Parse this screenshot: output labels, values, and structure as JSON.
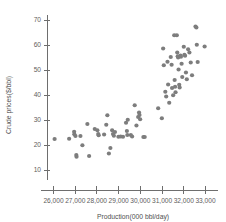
{
  "chart": {
    "title_fragment": "",
    "marker_color": "#7d7d7d",
    "axis_color": "#6e6e6e",
    "text_color": "#5d5d5d"
  },
  "chart_data": {
    "type": "scatter",
    "title": "",
    "xlabel": "Production(000 bbl/day)",
    "ylabel": "Crude prices($/bbl)",
    "xlim": [
      25700,
      33300
    ],
    "ylim": [
      6,
      73
    ],
    "xticks": [
      26000,
      27000,
      28000,
      29000,
      30000,
      31000,
      32000,
      33000
    ],
    "xtick_labels": [
      "26,000",
      "27,000",
      "28,000",
      "29,000",
      "30,000",
      "31,000",
      "32,000",
      "33,000"
    ],
    "yticks": [
      10,
      20,
      30,
      40,
      50,
      60,
      70
    ],
    "ytick_labels": [
      "10",
      "20",
      "30",
      "40",
      "50",
      "60",
      "70"
    ],
    "grid": false,
    "legend": null,
    "marker_size": 2.1,
    "points": [
      [
        26050,
        22.4
      ],
      [
        26720,
        22.5
      ],
      [
        26950,
        25.3
      ],
      [
        26960,
        24.3
      ],
      [
        27010,
        23.6
      ],
      [
        27050,
        16.0
      ],
      [
        27060,
        15.3
      ],
      [
        27240,
        23.6
      ],
      [
        27330,
        19.9
      ],
      [
        27560,
        28.4
      ],
      [
        27640,
        15.6
      ],
      [
        27900,
        26.4
      ],
      [
        28020,
        25.9
      ],
      [
        28060,
        24.4
      ],
      [
        28080,
        23.9
      ],
      [
        28330,
        24.2
      ],
      [
        28430,
        28.1
      ],
      [
        28480,
        31.9
      ],
      [
        28550,
        16.6
      ],
      [
        28620,
        18.8
      ],
      [
        28700,
        25.9
      ],
      [
        28740,
        24.4
      ],
      [
        28780,
        23.7
      ],
      [
        28830,
        25.2
      ],
      [
        28990,
        23.3
      ],
      [
        29090,
        23.4
      ],
      [
        29200,
        23.3
      ],
      [
        29340,
        28.9
      ],
      [
        29380,
        25.6
      ],
      [
        29400,
        24.0
      ],
      [
        29420,
        30.1
      ],
      [
        29560,
        24.0
      ],
      [
        29620,
        23.4
      ],
      [
        29740,
        35.9
      ],
      [
        29820,
        27.8
      ],
      [
        29900,
        31.2
      ],
      [
        29940,
        33.0
      ],
      [
        29960,
        32.0
      ],
      [
        29990,
        30.3
      ],
      [
        30140,
        23.2
      ],
      [
        30200,
        23.2
      ],
      [
        30820,
        34.7
      ],
      [
        30990,
        30.7
      ],
      [
        31050,
        58.6
      ],
      [
        31080,
        51.9
      ],
      [
        31150,
        41.3
      ],
      [
        31190,
        39.4
      ],
      [
        31250,
        53.3
      ],
      [
        31280,
        44.2
      ],
      [
        31330,
        36.9
      ],
      [
        31400,
        55.2
      ],
      [
        31440,
        52.1
      ],
      [
        31460,
        42.8
      ],
      [
        31510,
        39.9
      ],
      [
        31560,
        63.9
      ],
      [
        31580,
        46.0
      ],
      [
        31600,
        43.3
      ],
      [
        31620,
        41.1
      ],
      [
        31680,
        63.9
      ],
      [
        31700,
        57.0
      ],
      [
        31720,
        55.5
      ],
      [
        31740,
        55.0
      ],
      [
        31760,
        50.2
      ],
      [
        31790,
        44.1
      ],
      [
        31810,
        43.0
      ],
      [
        31850,
        55.8
      ],
      [
        31870,
        55.3
      ],
      [
        31900,
        52.5
      ],
      [
        31930,
        47.2
      ],
      [
        32000,
        59.3
      ],
      [
        32030,
        56.1
      ],
      [
        32060,
        55.7
      ],
      [
        32100,
        49.0
      ],
      [
        32140,
        46.3
      ],
      [
        32200,
        58.3
      ],
      [
        32260,
        57.0
      ],
      [
        32320,
        53.0
      ],
      [
        32380,
        47.9
      ],
      [
        32540,
        67.4
      ],
      [
        32580,
        67.0
      ],
      [
        32600,
        60.1
      ],
      [
        32640,
        53.2
      ],
      [
        32960,
        59.4
      ]
    ]
  }
}
